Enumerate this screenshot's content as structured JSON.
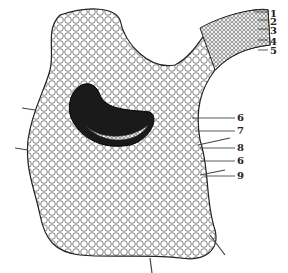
{
  "diagram": {
    "type": "botanical cross-section",
    "labels": [
      {
        "id": "1",
        "text": "1",
        "x": 270,
        "y": 9
      },
      {
        "id": "2",
        "text": "2",
        "x": 270,
        "y": 17
      },
      {
        "id": "3",
        "text": "3",
        "x": 270,
        "y": 26
      },
      {
        "id": "4",
        "text": "4",
        "x": 270,
        "y": 37
      },
      {
        "id": "5",
        "text": "5",
        "x": 270,
        "y": 48
      },
      {
        "id": "6a",
        "text": "6",
        "x": 237,
        "y": 114
      },
      {
        "id": "7",
        "text": "7",
        "x": 237,
        "y": 127
      },
      {
        "id": "8",
        "text": "8",
        "x": 237,
        "y": 144
      },
      {
        "id": "6b",
        "text": "6",
        "x": 237,
        "y": 157
      },
      {
        "id": "9",
        "text": "9",
        "x": 237,
        "y": 172
      }
    ]
  }
}
